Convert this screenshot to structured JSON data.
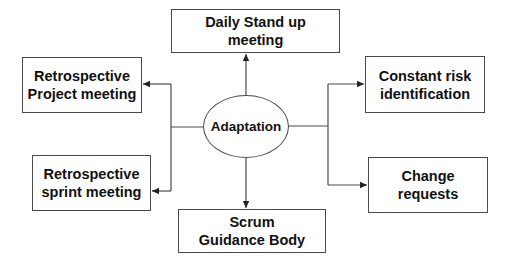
{
  "diagram": {
    "center": {
      "label": "Adaptation"
    },
    "nodes": {
      "top": {
        "label": "Daily Stand up\nmeeting"
      },
      "left_top": {
        "label": "Retrospective\nProject meeting"
      },
      "left_bottom": {
        "label": "Retrospective\nsprint meeting"
      },
      "bottom": {
        "label": "Scrum\nGuidance Body"
      },
      "right_top": {
        "label": "Constant risk\nidentification"
      },
      "right_bottom": {
        "label": "Change\nrequests"
      }
    },
    "edges": [
      {
        "from": "Adaptation",
        "to": "Daily Stand up meeting"
      },
      {
        "from": "Adaptation",
        "to": "Retrospective Project meeting"
      },
      {
        "from": "Adaptation",
        "to": "Retrospective sprint meeting"
      },
      {
        "from": "Adaptation",
        "to": "Scrum Guidance Body"
      },
      {
        "from": "Adaptation",
        "to": "Constant risk identification"
      },
      {
        "from": "Adaptation",
        "to": "Change requests"
      }
    ],
    "colors": {
      "line": "#4a4a4a",
      "text": "#111111",
      "background": "#ffffff"
    }
  }
}
